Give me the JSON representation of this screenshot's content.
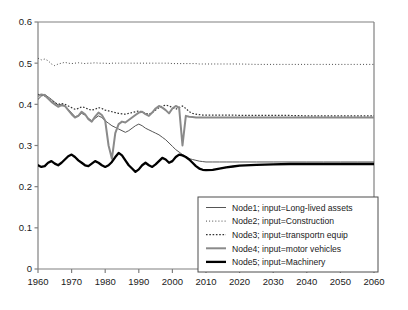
{
  "chart_data": {
    "type": "line",
    "title": "",
    "xlabel": "",
    "ylabel": "",
    "xlim": [
      1960,
      2060
    ],
    "ylim": [
      0,
      0.6
    ],
    "grid": false,
    "legend_position": "bottom-right",
    "xticks": [
      "1960",
      "1970",
      "1980",
      "1990",
      "2000",
      "2010",
      "2020",
      "2030",
      "2040",
      "2050",
      "2060"
    ],
    "xtick_values": [
      1960,
      1970,
      1980,
      1990,
      2000,
      2010,
      2020,
      2030,
      2040,
      2050,
      2060
    ],
    "yticks": [
      "0",
      "0.1",
      "0.2",
      "0.3",
      "0.4",
      "0.5",
      "0.6"
    ],
    "ytick_values": [
      0,
      0.1,
      0.2,
      0.3,
      0.4,
      0.5,
      0.6
    ],
    "x": [
      1960,
      1961,
      1962,
      1963,
      1964,
      1965,
      1966,
      1967,
      1968,
      1969,
      1970,
      1971,
      1972,
      1973,
      1974,
      1975,
      1976,
      1977,
      1978,
      1979,
      1980,
      1981,
      1982,
      1983,
      1984,
      1985,
      1986,
      1987,
      1988,
      1989,
      1990,
      1991,
      1992,
      1993,
      1994,
      1995,
      1996,
      1997,
      1998,
      1999,
      2000,
      2001,
      2002,
      2003,
      2004,
      2005,
      2006,
      2007,
      2008,
      2009,
      2010,
      2012,
      2014,
      2016,
      2018,
      2020,
      2025,
      2030,
      2035,
      2040,
      2045,
      2050,
      2055,
      2060
    ],
    "series": [
      {
        "name": "Node1; input=Long-lived assets",
        "style": "solid",
        "color": "#555555",
        "width": 1.0,
        "values": [
          0.412,
          0.42,
          0.424,
          0.418,
          0.412,
          0.405,
          0.398,
          0.4,
          0.396,
          0.388,
          0.379,
          0.37,
          0.372,
          0.378,
          0.374,
          0.366,
          0.36,
          0.366,
          0.372,
          0.368,
          0.36,
          0.354,
          0.348,
          0.344,
          0.34,
          0.336,
          0.332,
          0.336,
          0.342,
          0.348,
          0.352,
          0.348,
          0.342,
          0.338,
          0.334,
          0.33,
          0.326,
          0.32,
          0.314,
          0.306,
          0.298,
          0.29,
          0.284,
          0.278,
          0.272,
          0.268,
          0.266,
          0.264,
          0.262,
          0.261,
          0.26,
          0.26,
          0.26,
          0.26,
          0.26,
          0.26,
          0.26,
          0.26,
          0.26,
          0.26,
          0.26,
          0.26,
          0.26,
          0.26
        ]
      },
      {
        "name": "Node2; input=Construction",
        "style": "dotted-fine",
        "color": "#4a4a4a",
        "width": 1.0,
        "values": [
          0.512,
          0.508,
          0.51,
          0.506,
          0.498,
          0.494,
          0.498,
          0.5,
          0.502,
          0.5,
          0.499,
          0.5,
          0.501,
          0.5,
          0.499,
          0.5,
          0.5,
          0.501,
          0.5,
          0.5,
          0.5,
          0.499,
          0.5,
          0.5,
          0.5,
          0.5,
          0.5,
          0.5,
          0.5,
          0.5,
          0.5,
          0.5,
          0.5,
          0.5,
          0.5,
          0.5,
          0.5,
          0.5,
          0.5,
          0.5,
          0.499,
          0.499,
          0.499,
          0.499,
          0.499,
          0.499,
          0.499,
          0.499,
          0.498,
          0.498,
          0.498,
          0.498,
          0.498,
          0.498,
          0.498,
          0.498,
          0.497,
          0.497,
          0.497,
          0.497,
          0.497,
          0.497,
          0.497,
          0.497
        ]
      },
      {
        "name": "Node3; input=transportn equip",
        "style": "dotted",
        "color": "#333333",
        "width": 1.2,
        "values": [
          0.424,
          0.422,
          0.42,
          0.414,
          0.408,
          0.404,
          0.4,
          0.402,
          0.4,
          0.396,
          0.392,
          0.388,
          0.39,
          0.394,
          0.392,
          0.388,
          0.386,
          0.388,
          0.392,
          0.39,
          0.386,
          0.384,
          0.382,
          0.38,
          0.378,
          0.377,
          0.376,
          0.378,
          0.38,
          0.382,
          0.384,
          0.382,
          0.378,
          0.376,
          0.38,
          0.386,
          0.392,
          0.396,
          0.398,
          0.396,
          0.392,
          0.388,
          0.392,
          0.396,
          0.39,
          0.382,
          0.378,
          0.376,
          0.375,
          0.374,
          0.374,
          0.374,
          0.374,
          0.374,
          0.374,
          0.373,
          0.373,
          0.373,
          0.373,
          0.372,
          0.372,
          0.372,
          0.372,
          0.372
        ]
      },
      {
        "name": "Node4; input=motor vehicles",
        "style": "solid",
        "color": "#8a8a8a",
        "width": 2.0,
        "values": [
          0.42,
          0.424,
          0.422,
          0.414,
          0.406,
          0.4,
          0.394,
          0.398,
          0.396,
          0.386,
          0.376,
          0.368,
          0.372,
          0.382,
          0.376,
          0.364,
          0.358,
          0.37,
          0.38,
          0.374,
          0.36,
          0.3,
          0.268,
          0.33,
          0.352,
          0.358,
          0.356,
          0.362,
          0.368,
          0.374,
          0.38,
          0.382,
          0.376,
          0.372,
          0.38,
          0.39,
          0.396,
          0.392,
          0.386,
          0.378,
          0.39,
          0.396,
          0.392,
          0.3,
          0.372,
          0.37,
          0.369,
          0.368,
          0.368,
          0.368,
          0.368,
          0.368,
          0.368,
          0.368,
          0.368,
          0.368,
          0.368,
          0.368,
          0.368,
          0.368,
          0.368,
          0.368,
          0.368,
          0.368
        ]
      },
      {
        "name": "Node5; input=Machinery",
        "style": "solid",
        "color": "#000000",
        "width": 2.3,
        "values": [
          0.252,
          0.248,
          0.25,
          0.258,
          0.262,
          0.256,
          0.252,
          0.258,
          0.266,
          0.274,
          0.278,
          0.272,
          0.264,
          0.258,
          0.252,
          0.25,
          0.256,
          0.262,
          0.258,
          0.252,
          0.248,
          0.252,
          0.26,
          0.272,
          0.282,
          0.276,
          0.264,
          0.252,
          0.244,
          0.236,
          0.242,
          0.252,
          0.258,
          0.252,
          0.248,
          0.254,
          0.262,
          0.27,
          0.266,
          0.258,
          0.262,
          0.272,
          0.278,
          0.276,
          0.272,
          0.266,
          0.258,
          0.25,
          0.244,
          0.241,
          0.24,
          0.241,
          0.244,
          0.247,
          0.249,
          0.251,
          0.253,
          0.254,
          0.255,
          0.255,
          0.255,
          0.255,
          0.255,
          0.255
        ]
      }
    ]
  },
  "legend": {
    "items": [
      {
        "label": "Node1; input=Long-lived assets",
        "swatch": "thin-gray-solid-line-icon"
      },
      {
        "label": "Node2; input=Construction",
        "swatch": "fine-dotted-line-icon"
      },
      {
        "label": "Node3; input=transportn equip",
        "swatch": "dotted-line-icon"
      },
      {
        "label": "Node4; input=motor vehicles",
        "swatch": "thick-gray-solid-line-icon"
      },
      {
        "label": "Node5; input=Machinery",
        "swatch": "thick-black-solid-line-icon"
      }
    ]
  },
  "colors": {
    "node1": "#555555",
    "node2": "#4a4a4a",
    "node3": "#333333",
    "node4": "#8a8a8a",
    "node5": "#000000",
    "axis": "#808080",
    "text": "#1a1a1a",
    "legend_border": "#4d4d4d",
    "background": "#ffffff"
  }
}
